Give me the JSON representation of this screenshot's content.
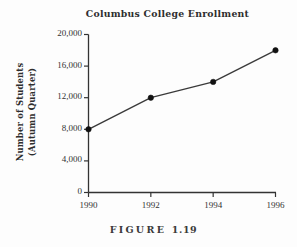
{
  "figure": {
    "caption_word": "FIGURE",
    "caption_number": "1.19"
  },
  "colors": {
    "background": "#fdfdfd",
    "axis": "#333333",
    "line": "#3a3a3a",
    "marker": "#111111",
    "text": "#2e2e2e"
  },
  "chart_data": {
    "type": "line",
    "title": "Columbus College Enrollment",
    "xlabel": "",
    "ylabel": "Number of Students (Autumn Quarter)",
    "ylabel_lines": [
      "Number of Students",
      "(Autumn Quarter)"
    ],
    "categories": [
      "1990",
      "1992",
      "1994",
      "1996"
    ],
    "x": [
      1990,
      1992,
      1994,
      1996
    ],
    "values": [
      8000,
      12000,
      14000,
      18000
    ],
    "series": [
      {
        "name": "Enrollment",
        "values": [
          8000,
          12000,
          14000,
          18000
        ]
      }
    ],
    "xtick_labels": [
      "1990",
      "1992",
      "1994",
      "1996"
    ],
    "ytick_labels": [
      "20,000",
      "16,000",
      "12,000",
      "8,000",
      "4,000",
      "0"
    ],
    "ytick_values": [
      20000,
      16000,
      12000,
      8000,
      4000,
      0
    ],
    "ylim": [
      0,
      20000
    ],
    "xlim": [
      1990,
      1996
    ],
    "grid": false,
    "legend": false,
    "markers": "filled-circle"
  }
}
